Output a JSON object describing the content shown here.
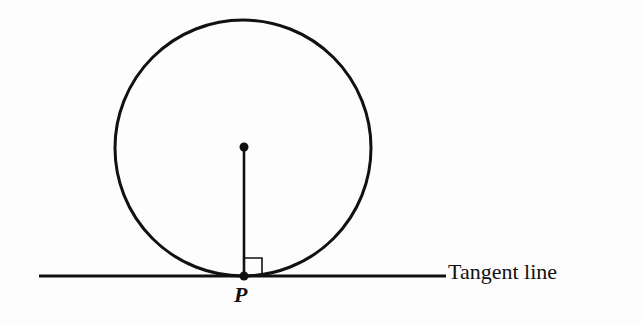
{
  "figure": {
    "type": "geometry-diagram",
    "labels": {
      "point": "P",
      "tangent": "Tangent line"
    },
    "elements": {
      "circle": {
        "cx": 243,
        "cy": 148,
        "r": 128
      },
      "center_point": {
        "x": 244,
        "y": 147
      },
      "radius_segment": {
        "from": "center",
        "to": "P"
      },
      "tangent_line": {
        "x1": 39,
        "x2": 446,
        "y": 276
      },
      "point_p": {
        "x": 244,
        "y": 276
      },
      "right_angle_marker": {
        "size": 18
      }
    },
    "colors": {
      "stroke": "#111111",
      "background": "#fdfdfd"
    }
  }
}
